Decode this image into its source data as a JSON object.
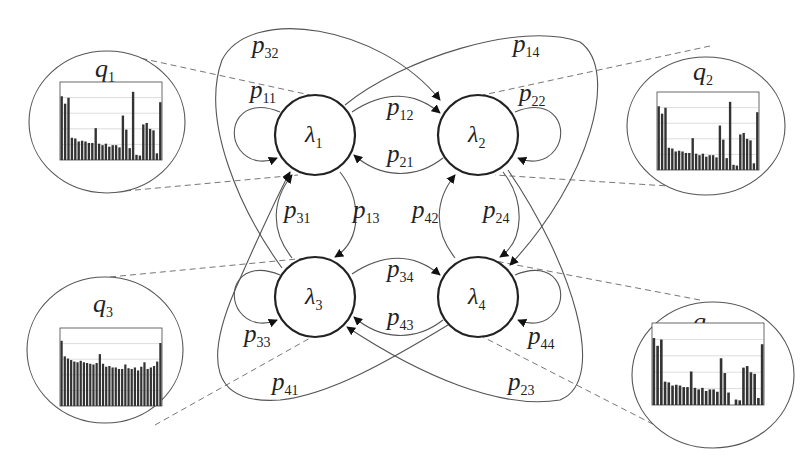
{
  "diagram": {
    "type": "Hidden Markov Model state-transition diagram",
    "states": [
      {
        "id": "1",
        "label": "λ",
        "sub": "1"
      },
      {
        "id": "2",
        "label": "λ",
        "sub": "2"
      },
      {
        "id": "3",
        "label": "λ",
        "sub": "3"
      },
      {
        "id": "4",
        "label": "λ",
        "sub": "4"
      }
    ],
    "transitions": [
      {
        "label": "p",
        "sub": "11",
        "from": "1",
        "to": "1"
      },
      {
        "label": "p",
        "sub": "12",
        "from": "1",
        "to": "2"
      },
      {
        "label": "p",
        "sub": "13",
        "from": "1",
        "to": "3"
      },
      {
        "label": "p",
        "sub": "14",
        "from": "1",
        "to": "4"
      },
      {
        "label": "p",
        "sub": "21",
        "from": "2",
        "to": "1"
      },
      {
        "label": "p",
        "sub": "22",
        "from": "2",
        "to": "2"
      },
      {
        "label": "p",
        "sub": "23",
        "from": "2",
        "to": "3"
      },
      {
        "label": "p",
        "sub": "24",
        "from": "2",
        "to": "4"
      },
      {
        "label": "p",
        "sub": "31",
        "from": "3",
        "to": "1"
      },
      {
        "label": "p",
        "sub": "32",
        "from": "3",
        "to": "2"
      },
      {
        "label": "p",
        "sub": "33",
        "from": "3",
        "to": "3"
      },
      {
        "label": "p",
        "sub": "34",
        "from": "3",
        "to": "4"
      },
      {
        "label": "p",
        "sub": "41",
        "from": "4",
        "to": "1"
      },
      {
        "label": "p",
        "sub": "42",
        "from": "4",
        "to": "2"
      },
      {
        "label": "p",
        "sub": "43",
        "from": "4",
        "to": "3"
      },
      {
        "label": "p",
        "sub": "44",
        "from": "4",
        "to": "4"
      }
    ],
    "emissions": [
      {
        "label": "q",
        "sub": "1",
        "state": "1"
      },
      {
        "label": "q",
        "sub": "2",
        "state": "2"
      },
      {
        "label": "q",
        "sub": "3",
        "state": "3"
      },
      {
        "label": "q",
        "sub": "4",
        "state": "4"
      }
    ]
  },
  "histograms": {
    "q1": [
      0.86,
      0.76,
      0.84,
      0.3,
      0.29,
      0.25,
      0.26,
      0.25,
      0.23,
      0.23,
      0.43,
      0.22,
      0.2,
      0.22,
      0.18,
      0.2,
      0.2,
      0.17,
      0.6,
      0.41,
      0.16,
      0.92,
      0.07,
      0.06,
      0.48,
      0.5,
      0.42,
      0.4,
      0.09,
      0.78
    ],
    "q2": [
      0.86,
      0.76,
      0.84,
      0.3,
      0.29,
      0.25,
      0.26,
      0.25,
      0.23,
      0.23,
      0.43,
      0.22,
      0.2,
      0.22,
      0.18,
      0.2,
      0.2,
      0.17,
      0.6,
      0.41,
      0.16,
      0.92,
      0.07,
      0.06,
      0.48,
      0.5,
      0.42,
      0.4,
      0.09,
      0.78
    ],
    "q3": [
      0.88,
      0.67,
      0.64,
      0.62,
      0.6,
      0.59,
      0.61,
      0.59,
      0.58,
      0.57,
      0.56,
      0.58,
      0.7,
      0.57,
      0.53,
      0.54,
      0.52,
      0.52,
      0.5,
      0.5,
      0.56,
      0.51,
      0.5,
      0.52,
      0.48,
      0.53,
      0.59,
      0.5,
      0.52,
      0.54,
      0.6,
      0.85
    ],
    "q4": [
      0.86,
      0.76,
      0.84,
      0.3,
      0.29,
      0.25,
      0.26,
      0.25,
      0.23,
      0.23,
      0.43,
      0.22,
      0.2,
      0.22,
      0.18,
      0.2,
      0.2,
      0.17,
      0.6,
      0.41,
      0.16,
      0.0,
      0.07,
      0.06,
      0.48,
      0.5,
      0.42,
      0.4,
      0.09,
      0.78
    ]
  }
}
